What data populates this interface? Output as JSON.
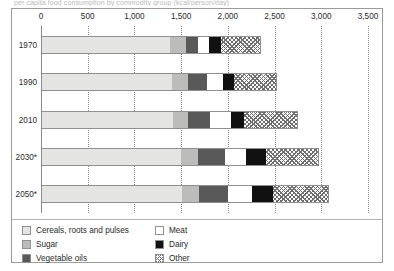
{
  "figure": {
    "clipped_title": "per capita food consumption by commodity group (kcal/person/day)"
  },
  "chart_data": {
    "type": "bar",
    "orientation": "horizontal",
    "stacked": true,
    "title": "",
    "subtitle": "",
    "xlabel": "",
    "ylabel": "",
    "xlim": [
      0,
      3500
    ],
    "xticks": [
      0,
      500,
      1000,
      1500,
      2000,
      2500,
      3000,
      3500
    ],
    "xtick_labels": [
      "0",
      "500",
      "1,000",
      "1,500",
      "2,000",
      "2,500",
      "3,000",
      "3,500"
    ],
    "grid": "vertical-dotted",
    "legend_position": "bottom",
    "categories": [
      "1970",
      "1990",
      "2010",
      "2030*",
      "2050*"
    ],
    "series": [
      {
        "name": "Cereals, roots and pulses",
        "key": "cereals",
        "color": "#e4e4e2",
        "values": [
          1370,
          1395,
          1400,
          1490,
          1500
        ]
      },
      {
        "name": "Sugar",
        "key": "sugar",
        "color": "#bcbcbb",
        "values": [
          175,
          170,
          165,
          175,
          185
        ]
      },
      {
        "name": "Vegetable oils",
        "key": "veg",
        "color": "#595959",
        "values": [
          130,
          200,
          230,
          290,
          310
        ]
      },
      {
        "name": "Meat",
        "key": "meat",
        "color": "#ffffff",
        "values": [
          115,
          175,
          225,
          225,
          250
        ]
      },
      {
        "name": "Dairy",
        "key": "dairy",
        "color": "#111111",
        "values": [
          130,
          120,
          145,
          215,
          230
        ]
      },
      {
        "name": "Other",
        "key": "other",
        "color": "hatched",
        "values": [
          420,
          460,
          580,
          570,
          595
        ]
      }
    ],
    "totals": [
      2340,
      2520,
      2745,
      2965,
      3070
    ]
  },
  "legend": {
    "columns": [
      [
        "Cereals, roots and pulses",
        "Sugar",
        "Vegetable oils"
      ],
      [
        "Meat",
        "Dairy",
        "Other"
      ]
    ]
  }
}
